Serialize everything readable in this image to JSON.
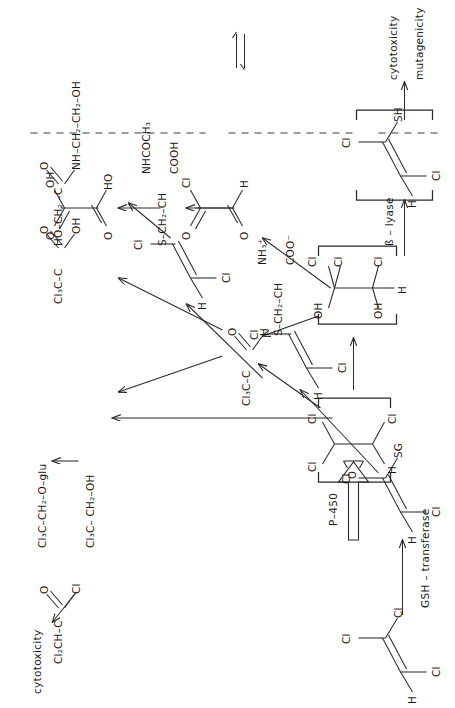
{
  "figure": {
    "orientation": "rotated-90",
    "ink_color": "#2a2a2a",
    "background": "#ffffff"
  },
  "structures": {
    "tce": {
      "id": "trichloroethylene",
      "atom_top_left": "Cl",
      "atom_top_right": "Cl",
      "atom_bottom_left": "H",
      "atom_bottom_right": "Cl"
    },
    "epoxide": {
      "id": "tce-epoxide",
      "atom_top_left": "Cl",
      "atom_top_right": "Cl",
      "atom_bottom_left": "H",
      "atom_bottom_right": "Cl",
      "bridge": "O",
      "bracketed": true
    },
    "hydrate": {
      "id": "chloral-hydrate-diol",
      "atom_top_left": "OH",
      "atom_top_right": "Cl",
      "atom_top_right2": "Cl",
      "atom_bottom_left": "OH",
      "atom_bottom_right": "Cl",
      "atom_bottom_far": "H",
      "bracketed": true
    },
    "gsh_conj": {
      "id": "glutathione-conjugate",
      "atom_top_left": "Cl",
      "atom_top_right": "SG",
      "atom_bottom_left": "H",
      "atom_bottom_right": "Cl"
    },
    "cys_conj": {
      "id": "cysteine-conjugate",
      "atom_top_left": "Cl",
      "atom_bottom_left": "H",
      "atom_bottom_right": "Cl",
      "chain": "S–CH₂–CH",
      "upper_group": "NH₃⁺",
      "lower_group": "COO⁻"
    },
    "mercapturate": {
      "id": "mercapturic-acid",
      "atom_top_left": "Cl",
      "atom_bottom_left": "H",
      "atom_bottom_right": "Cl",
      "chain": "S–CH₂–CH",
      "upper_group": "NHCOCH₃",
      "lower_group": "COOH"
    },
    "thiol": {
      "id": "reactive-thiol",
      "atom_top_left": "Cl",
      "atom_top_right": "SH",
      "atom_bottom_left": "H",
      "atom_bottom_right": "Cl",
      "bracketed": true
    },
    "chloral": {
      "id": "chloral",
      "left": "Cl₃C–C",
      "double_bond_atom": "O",
      "single_bond_atom": "H"
    },
    "dca": {
      "id": "dichloroacetic-acid",
      "left": "Cl₂CH–C",
      "double_bond_atom": "O",
      "single_bond_atom": "OH"
    },
    "tca": {
      "id": "trichloroacetic-acid",
      "left": "Cl₃C–C",
      "double_bond_atom": "O",
      "single_bond_atom": "OH"
    },
    "tce_oh": {
      "id": "trichloroethanol",
      "formula": "Cl₃C– CH₂–OH"
    },
    "tce_glu": {
      "id": "trichloroethanol-glucuronide",
      "formula": "Cl₃C–CH₂–O–glu"
    },
    "amide": {
      "id": "n-hydroxyethyl-glycolamide",
      "formula_left": "HO–CH₂ –C",
      "formula_right": "NH–CH₂–CH₂–OH",
      "double_bond_atom": "O"
    },
    "acyl": {
      "id": "glyoxylyl-chloride",
      "top_left": "O",
      "top_right": "Cl",
      "bottom_left": "O",
      "bottom_right": "H"
    },
    "oxalic": {
      "id": "oxalic-acid",
      "top_left": "O",
      "top_right": "OH",
      "bottom_left": "O",
      "bottom_right": "HO"
    },
    "dca_top": {
      "id": "dichloroacetyl-chloride",
      "left": "Cl₂CH–C",
      "double_bond_atom": "O",
      "single_bond_atom": "Cl"
    }
  },
  "labels": {
    "p450": "P–450",
    "gsh_transferase": "GSH – transferase",
    "beta_lyase": "ß – lyase",
    "cytotoxicity_left": "cytotoxicity",
    "cytotoxicity_right": "cytotoxicity",
    "mutagenicity_right": "mutagenicity"
  },
  "text_atoms": {
    "cl": "Cl",
    "h": "H",
    "o": "O",
    "oh": "OH",
    "ho": "HO",
    "sh": "SH",
    "sg": "SG",
    "s": "S"
  }
}
